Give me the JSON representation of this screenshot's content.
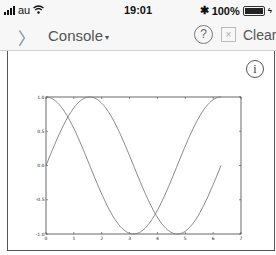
{
  "status_bar": {
    "carrier": "au",
    "time": "19:01",
    "battery_percent": "100%"
  },
  "nav": {
    "back_icon": "chevron-right-icon",
    "title": "Console",
    "title_caret": "▾",
    "help_icon": "?",
    "clear_icon": "×",
    "clear_label": "Clear"
  },
  "console": {
    "info_icon": "i"
  },
  "chart_data": {
    "type": "line",
    "title": "",
    "xlabel": "",
    "ylabel": "",
    "xlim": [
      0,
      7
    ],
    "ylim": [
      -1.0,
      1.0
    ],
    "grid": false,
    "x_ticks": [
      "0",
      "1",
      "2",
      "3",
      "4",
      "5",
      "6",
      "7"
    ],
    "y_ticks": [
      "1.0",
      "0.5",
      "0.0",
      "-0.5",
      "-1.0"
    ],
    "y_tick_values": [
      1.0,
      0.5,
      0.0,
      -0.5,
      -1.0
    ],
    "x_range": [
      0,
      6.2832
    ],
    "series": [
      {
        "name": "sin(x)",
        "function": "sin",
        "color": "#777777"
      },
      {
        "name": "cos(x)",
        "function": "cos",
        "color": "#777777"
      }
    ]
  }
}
